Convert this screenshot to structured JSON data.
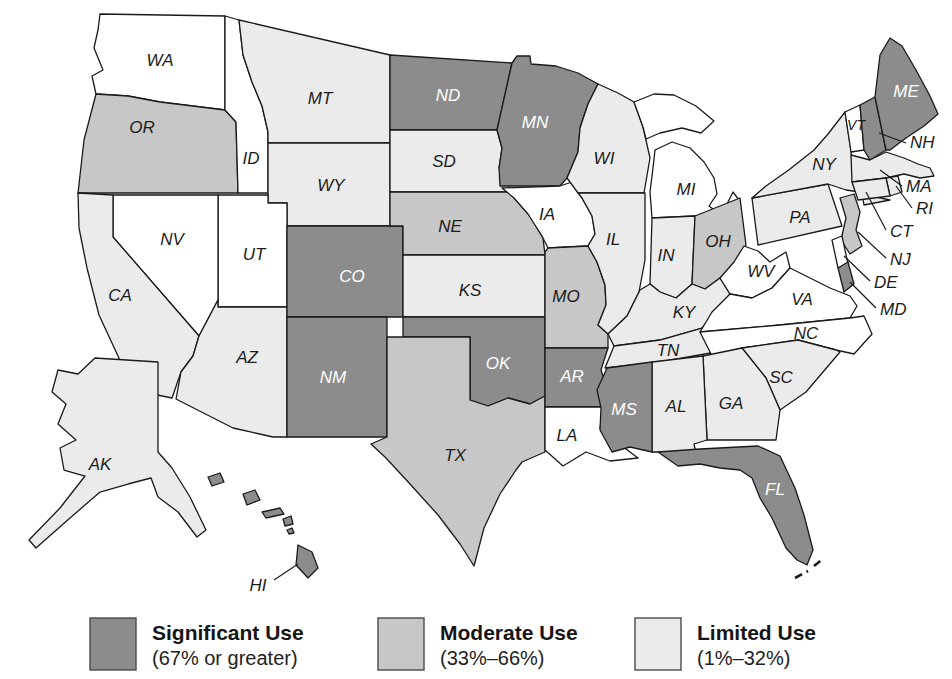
{
  "colors": {
    "significant": "#8c8c8c",
    "moderate": "#c7c7c7",
    "limited": "#ebebeb",
    "none": "#ffffff",
    "outline": "#1a1a1a"
  },
  "legend": [
    {
      "key": "significant",
      "label": "Significant Use",
      "range": "(67% or greater)"
    },
    {
      "key": "moderate",
      "label": "Moderate Use",
      "range": "(33%–66%)"
    },
    {
      "key": "limited",
      "label": "Limited Use",
      "range": "(1%–32%)"
    }
  ],
  "states": {
    "WA": {
      "abbr": "WA",
      "category": "none"
    },
    "OR": {
      "abbr": "OR",
      "category": "moderate"
    },
    "CA": {
      "abbr": "CA",
      "category": "limited"
    },
    "NV": {
      "abbr": "NV",
      "category": "none"
    },
    "ID": {
      "abbr": "ID",
      "category": "none"
    },
    "MT": {
      "abbr": "MT",
      "category": "limited"
    },
    "WY": {
      "abbr": "WY",
      "category": "limited"
    },
    "UT": {
      "abbr": "UT",
      "category": "none"
    },
    "AZ": {
      "abbr": "AZ",
      "category": "limited"
    },
    "CO": {
      "abbr": "CO",
      "category": "significant"
    },
    "NM": {
      "abbr": "NM",
      "category": "significant"
    },
    "ND": {
      "abbr": "ND",
      "category": "significant"
    },
    "SD": {
      "abbr": "SD",
      "category": "limited"
    },
    "NE": {
      "abbr": "NE",
      "category": "moderate"
    },
    "KS": {
      "abbr": "KS",
      "category": "limited"
    },
    "OK": {
      "abbr": "OK",
      "category": "significant"
    },
    "TX": {
      "abbr": "TX",
      "category": "moderate"
    },
    "MN": {
      "abbr": "MN",
      "category": "significant"
    },
    "IA": {
      "abbr": "IA",
      "category": "none"
    },
    "MO": {
      "abbr": "MO",
      "category": "moderate"
    },
    "AR": {
      "abbr": "AR",
      "category": "significant"
    },
    "LA": {
      "abbr": "LA",
      "category": "none"
    },
    "WI": {
      "abbr": "WI",
      "category": "limited"
    },
    "IL": {
      "abbr": "IL",
      "category": "limited"
    },
    "MI": {
      "abbr": "MI",
      "category": "none"
    },
    "IN": {
      "abbr": "IN",
      "category": "limited"
    },
    "OH": {
      "abbr": "OH",
      "category": "moderate"
    },
    "KY": {
      "abbr": "KY",
      "category": "limited"
    },
    "TN": {
      "abbr": "TN",
      "category": "limited"
    },
    "MS": {
      "abbr": "MS",
      "category": "significant"
    },
    "AL": {
      "abbr": "AL",
      "category": "limited"
    },
    "GA": {
      "abbr": "GA",
      "category": "limited"
    },
    "SC": {
      "abbr": "SC",
      "category": "limited"
    },
    "NC": {
      "abbr": "NC",
      "category": "none"
    },
    "VA": {
      "abbr": "VA",
      "category": "none"
    },
    "WV": {
      "abbr": "WV",
      "category": "none"
    },
    "FL": {
      "abbr": "FL",
      "category": "significant"
    },
    "PA": {
      "abbr": "PA",
      "category": "limited"
    },
    "NY": {
      "abbr": "NY",
      "category": "limited"
    },
    "VT": {
      "abbr": "VT",
      "category": "none"
    },
    "NH": {
      "abbr": "NH",
      "category": "significant"
    },
    "ME": {
      "abbr": "ME",
      "category": "significant"
    },
    "MA": {
      "abbr": "MA",
      "category": "limited"
    },
    "RI": {
      "abbr": "RI",
      "category": "limited"
    },
    "CT": {
      "abbr": "CT",
      "category": "limited"
    },
    "NJ": {
      "abbr": "NJ",
      "category": "moderate"
    },
    "DE": {
      "abbr": "DE",
      "category": "none"
    },
    "MD": {
      "abbr": "MD",
      "category": "significant"
    },
    "AK": {
      "abbr": "AK",
      "category": "limited"
    },
    "HI": {
      "abbr": "HI",
      "category": "significant"
    }
  }
}
